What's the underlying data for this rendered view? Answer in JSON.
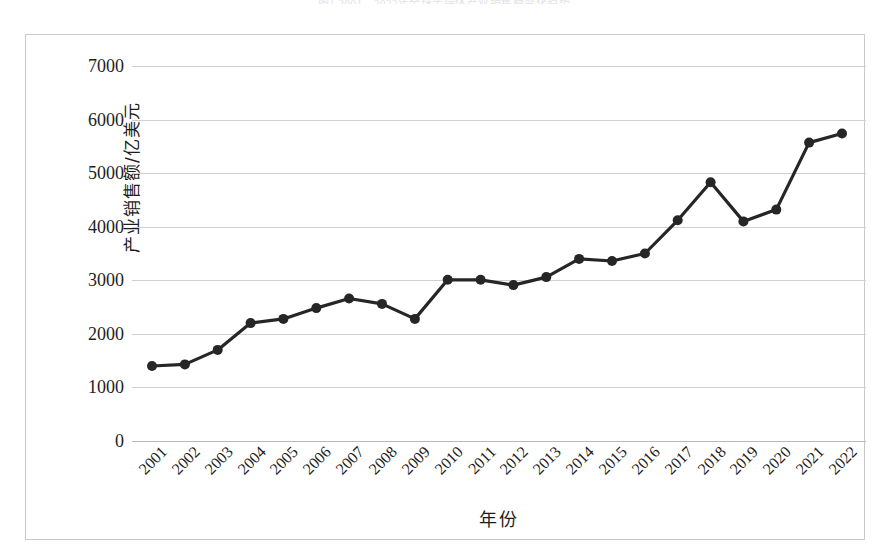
{
  "caption": "图1  2001—2022年全球半导体产业销售额变化趋势",
  "axis": {
    "y_title": "产业销售额/亿美元",
    "x_title": "年份",
    "y_ticks": [
      "0",
      "1000",
      "2000",
      "3000",
      "4000",
      "5000",
      "6000",
      "7000"
    ]
  },
  "colors": {
    "line": "#262626",
    "marker": "#262626",
    "grid": "#d0d0d4",
    "frame": "#c9c9cd",
    "text": "#1d1d1d"
  },
  "chart_data": {
    "type": "line",
    "title": "",
    "subtitle": "",
    "xlabel": "年份",
    "ylabel": "产业销售额/亿美元",
    "grid": true,
    "legend": "none",
    "ylim": [
      0,
      7000
    ],
    "ytick_step": 1000,
    "categories": [
      "2001",
      "2002",
      "2003",
      "2004",
      "2005",
      "2006",
      "2007",
      "2008",
      "2009",
      "2010",
      "2011",
      "2012",
      "2013",
      "2014",
      "2015",
      "2016",
      "2017",
      "2018",
      "2019",
      "2020",
      "2021",
      "2022"
    ],
    "values": [
      1400,
      1430,
      1700,
      2200,
      2280,
      2480,
      2660,
      2560,
      2280,
      3010,
      3010,
      2910,
      3060,
      3400,
      3360,
      3500,
      4120,
      4830,
      4100,
      4320,
      5570,
      5740
    ],
    "series": [
      {
        "name": "全球半导体产业销售额",
        "values": [
          1400,
          1430,
          1700,
          2200,
          2280,
          2480,
          2660,
          2560,
          2280,
          3010,
          3010,
          2910,
          3060,
          3400,
          3360,
          3500,
          4120,
          4830,
          4100,
          4320,
          5570,
          5740
        ]
      }
    ]
  }
}
